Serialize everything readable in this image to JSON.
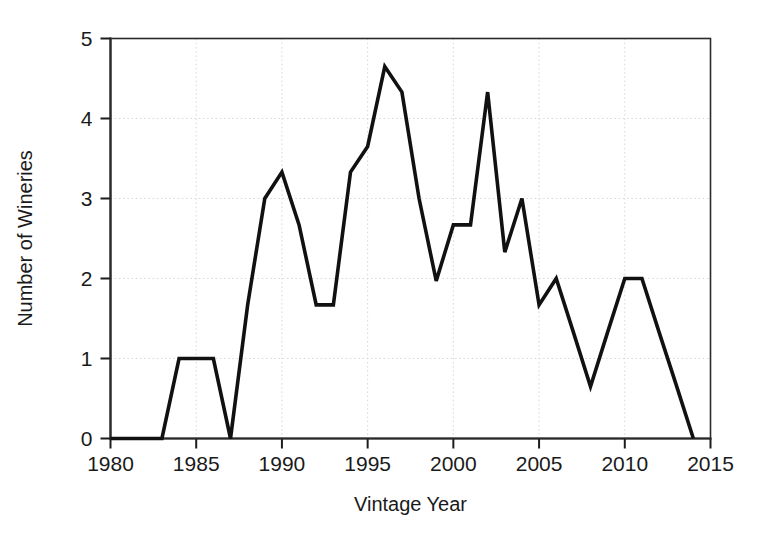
{
  "chart_data": {
    "type": "line",
    "title": "",
    "xlabel": "Vintage Year",
    "ylabel": "Number of Wineries",
    "xlim": [
      1980,
      2015
    ],
    "ylim": [
      0,
      5
    ],
    "xticks": [
      1980,
      1985,
      1990,
      1995,
      2000,
      2005,
      2010,
      2015
    ],
    "yticks": [
      0,
      1,
      2,
      3,
      4,
      5
    ],
    "xtick_labels": [
      "1980",
      "1985",
      "1990",
      "1995",
      "2000",
      "2005",
      "2010",
      "2015"
    ],
    "ytick_labels": [
      "0",
      "1",
      "2",
      "3",
      "4",
      "5"
    ],
    "grid": true,
    "legend": false,
    "line_color": "#111111",
    "grid_color": "#d8d8d8",
    "background_color": "#ffffff",
    "x": [
      1980,
      1981,
      1982,
      1983,
      1984,
      1985,
      1986,
      1987,
      1988,
      1989,
      1990,
      1991,
      1992,
      1993,
      1994,
      1995,
      1996,
      1997,
      1998,
      1999,
      2000,
      2001,
      2002,
      2003,
      2004,
      2005,
      2006,
      2007,
      2008,
      2009,
      2010,
      2011,
      2012,
      2013,
      2014
    ],
    "values": [
      0,
      0,
      0,
      0,
      1,
      1,
      1,
      0,
      1.67,
      3.0,
      3.33,
      2.67,
      1.67,
      1.67,
      3.33,
      3.65,
      4.65,
      4.33,
      3.0,
      1.97,
      2.67,
      2.67,
      4.33,
      2.33,
      3.0,
      1.67,
      2.0,
      1.33,
      0.65,
      1.33,
      2.0,
      2.0,
      1.33,
      0.67,
      0
    ]
  },
  "axes": {
    "x_title": "Vintage Year",
    "y_title": "Number of Wineries"
  }
}
